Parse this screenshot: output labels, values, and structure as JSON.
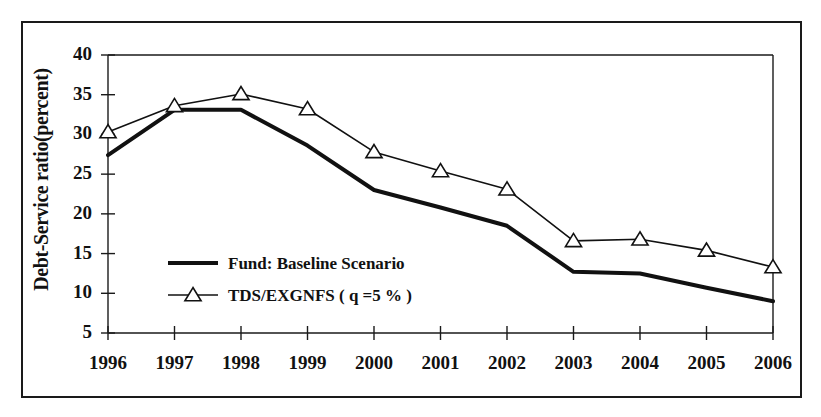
{
  "chart_data": {
    "type": "line",
    "title": "",
    "xlabel": "",
    "ylabel": "Debt-Service ratio(percent)",
    "categories": [
      "1996",
      "1997",
      "1998",
      "1999",
      "2000",
      "2001",
      "2002",
      "2003",
      "2004",
      "2005",
      "2006"
    ],
    "x": [
      1996,
      1997,
      1998,
      1999,
      2000,
      2001,
      2002,
      2003,
      2004,
      2005,
      2006
    ],
    "xlim": [
      1996,
      2006
    ],
    "ylim": [
      5,
      40
    ],
    "ytick_labels": [
      "5",
      "10",
      "15",
      "20",
      "25",
      "30",
      "35",
      "40"
    ],
    "yticks": [
      5,
      10,
      15,
      20,
      25,
      30,
      35,
      40
    ],
    "grid": false,
    "legend_position": "inside-lower-left",
    "series": [
      {
        "name": "Fund: Baseline Scenario",
        "marker": "none",
        "line_width": 4,
        "color": "#111111",
        "values": [
          27.4,
          33.1,
          33.1,
          28.6,
          23.0,
          20.8,
          18.5,
          12.7,
          12.5,
          10.7,
          9.0
        ]
      },
      {
        "name": "TDS/EXGNFS ( q =5 % )",
        "marker": "triangle-up-open",
        "line_width": 1.6,
        "color": "#111111",
        "values": [
          30.3,
          33.6,
          35.1,
          33.2,
          27.8,
          25.4,
          23.1,
          16.6,
          16.8,
          15.4,
          13.3
        ]
      }
    ]
  },
  "legend": {
    "items": [
      {
        "label": "Fund: Baseline Scenario",
        "marker": "thick-line"
      },
      {
        "label": "TDS/EXGNFS ( q =5 % )",
        "marker": "line-with-triangle"
      }
    ]
  },
  "axes": {
    "y_axis_title": "Debt-Service ratio(percent)"
  }
}
